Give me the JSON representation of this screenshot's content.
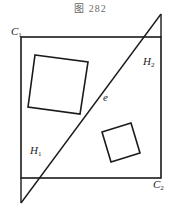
{
  "caption": "图 282",
  "labels": {
    "c1": {
      "main": "C",
      "sub": "1"
    },
    "c2": {
      "main": "C",
      "sub": "2"
    },
    "h1": {
      "main": "H",
      "sub": "1"
    },
    "h2": {
      "main": "H",
      "sub": "2"
    },
    "e": {
      "main": "e"
    }
  },
  "colors": {
    "stroke": "#1a1a1a",
    "background": "#ffffff"
  }
}
